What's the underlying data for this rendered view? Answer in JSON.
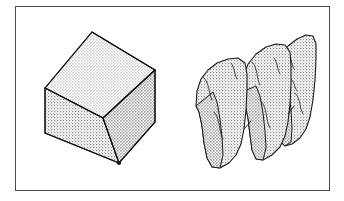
{
  "figure": {
    "title": "Solid block and the same block fractured into slabs",
    "kind": "line-art-illustration",
    "background_color": "#ffffff",
    "frame": {
      "name": "border-frame",
      "x": 15,
      "y": 6,
      "width": 315,
      "height": 185,
      "stroke_color": "#4a4a4a",
      "stroke_width": 1.4
    },
    "style": {
      "outline_color": "#1a1a1a",
      "outline_width": 1.1,
      "crack_color": "#2b2b2b",
      "crack_width": 0.85,
      "stipple_dot_color": "#808080",
      "stipple_background": "#fdfdfd",
      "stipple_spacing": 3
    },
    "objects": [
      {
        "name": "solid-cube",
        "label": "intact block",
        "position": "left",
        "description": "An intact stippled cube drawn in oblique projection with a visible top face, left face and right face meeting at a central Y junction.",
        "faces": [
          {
            "name": "cube-top-face",
            "points": "45,88 92,32 155,70 103,118"
          },
          {
            "name": "cube-left-face",
            "points": "45,88 103,118 119,163 45,133"
          },
          {
            "name": "cube-right-face",
            "points": "103,118 155,70 155,122 119,163"
          }
        ],
        "edges": [
          "45,88 92,32",
          "92,32 155,70",
          "155,70 155,122",
          "155,122 119,163",
          "119,163 45,133",
          "45,133 45,88",
          "45,88 103,118",
          "103,118 155,70",
          "103,118 119,163"
        ]
      },
      {
        "name": "fractured-block",
        "label": "fractured block",
        "position": "right",
        "description": "The same block broken into three rough vertical slabs that have separated slightly, with ragged fracture outlines and thin internal crack lines.",
        "slabs": [
          {
            "name": "slab-front-left",
            "outline": "196,94 200,82 208,73 219,66 231,62 240,60 246,63 248,72 247,86 246,104 245,126 242,141 238,152 231,160 222,166 214,168 208,164 205,153 203,136 200,118 197,106",
            "cracks": [
              "205,81 212,86 210,95 214,103",
              "216,114 222,121 219,131 224,140"
            ]
          },
          {
            "name": "slab-middle",
            "outline": "238,80 243,67 251,57 262,50 274,46 284,45 291,49 293,59 292,74 291,93 290,115 287,131 283,143 276,152 267,158 259,160 253,156 250,145 248,128 245,110 241,94",
            "cracks": [
              "252,68 259,74 257,84 261,92",
              "262,104 269,112 266,122 271,131"
            ]
          },
          {
            "name": "slab-back-right",
            "outline": "276,66 281,53 289,43 299,36 309,33 315,35 317,45 316,60 315,79 313,100 310,116 306,128 300,137 292,143 285,145 280,141 277,130 275,113 273,96 272,80",
            "cracks": [
              "288,54 295,60 293,70 297,78",
              "296,94 303,101 300,111 304,119"
            ]
          }
        ],
        "separation_gaps": [
          "245,128 253,120",
          "288,112 296,104"
        ]
      }
    ]
  }
}
